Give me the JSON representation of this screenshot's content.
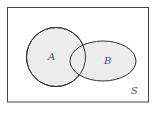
{
  "diagram": {
    "type": "venn",
    "universe": {
      "label": "S"
    },
    "sets": [
      {
        "label": "A",
        "shape": "circle"
      },
      {
        "label": "B",
        "shape": "ellipse"
      }
    ],
    "colors": {
      "fill": "#ececec",
      "stroke": "#333333",
      "frame": "#444444",
      "background": "#ffffff"
    }
  }
}
